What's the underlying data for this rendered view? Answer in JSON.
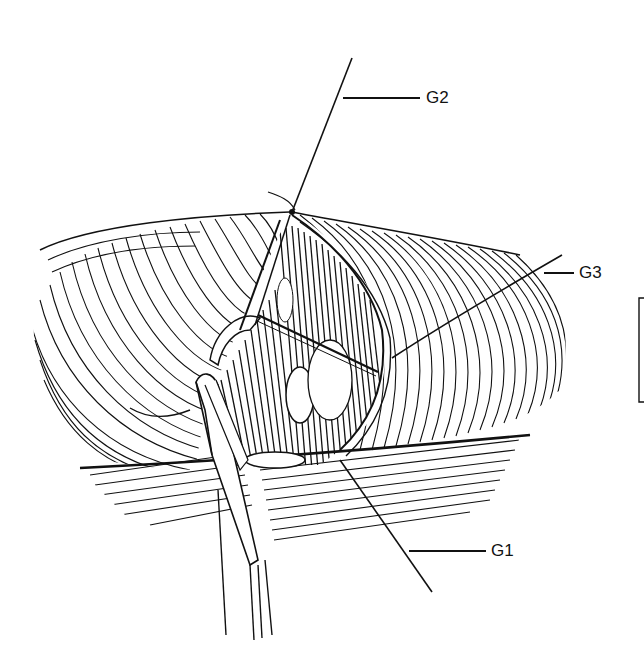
{
  "figure": {
    "type": "surgical line illustration",
    "background": "#ffffff",
    "ink_color": "#111111"
  },
  "labels": [
    {
      "id": "G1",
      "text": "G1"
    },
    {
      "id": "G2",
      "text": "G2"
    },
    {
      "id": "G3",
      "text": "G3"
    }
  ],
  "scale_bar": {
    "visible": true
  }
}
